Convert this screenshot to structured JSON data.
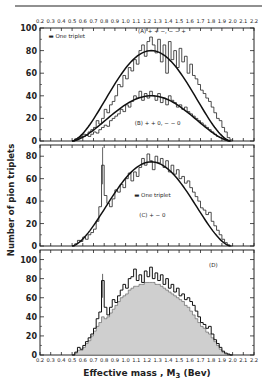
{
  "chart_data": {
    "type": "bar",
    "title": "",
    "xlabel": "Effective mass , M3 (Bev)",
    "xlabel_main": "Effective mass , M",
    "xlabel_sub": "3",
    "xlabel_tail": " (Bev)",
    "ylabel": "Number of pion triplets",
    "xlim": [
      0.2,
      2.2
    ],
    "xticks": [
      "0.2",
      "0.3",
      "0.4",
      "0.5",
      "0.6",
      "0.7",
      "0.8",
      "0.9",
      "1.0",
      "1.1",
      "1.2",
      "1.3",
      "1.4",
      "1.5",
      "1.6",
      "1.7",
      "1.8",
      "1.9",
      "2.0",
      "2.1",
      "2.2"
    ],
    "bin_start": 0.5,
    "bin_width": 0.025,
    "panels": [
      {
        "id": "A",
        "ylim": [
          0,
          100
        ],
        "yticks": [
          "0",
          "20",
          "40",
          "60",
          "80",
          "100"
        ],
        "labels": [
          {
            "text": "(A) + + −, − − +",
            "x": 1.34,
            "y": 96
          },
          {
            "text": "(B) + + 0, − − 0",
            "x": 1.3,
            "y": 14
          },
          {
            "text": "▬ One triplet",
            "x": 0.45,
            "y": 91
          }
        ],
        "series": [
          {
            "name": "(A) ++−,−−+",
            "values": [
              0,
              2,
              3,
              4,
              6,
              5,
              8,
              10,
              12,
              18,
              15,
              20,
              28,
              25,
              32,
              35,
              40,
              50,
              48,
              58,
              55,
              65,
              62,
              72,
              68,
              80,
              85,
              75,
              88,
              92,
              85,
              78,
              90,
              70,
              85,
              60,
              88,
              72,
              80,
              65,
              82,
              70,
              75,
              60,
              68,
              58,
              55,
              50,
              45,
              42,
              38,
              35,
              30,
              25,
              20,
              18,
              12,
              8,
              3,
              1
            ],
            "fit_peak": 80,
            "fit_center": 1.26
          },
          {
            "name": "(B) ++0,−−0",
            "values": [
              0,
              1,
              2,
              3,
              4,
              5,
              4,
              6,
              8,
              7,
              10,
              12,
              14,
              13,
              18,
              20,
              22,
              24,
              28,
              26,
              32,
              30,
              35,
              40,
              38,
              44,
              36,
              42,
              38,
              44,
              40,
              36,
              42,
              34,
              38,
              32,
              40,
              36,
              34,
              30,
              32,
              28,
              30,
              26,
              24,
              22,
              20,
              18,
              16,
              14,
              12,
              10,
              8,
              6,
              4,
              3,
              2,
              1,
              0,
              0
            ],
            "fit_peak": 40,
            "fit_center": 1.26
          }
        ]
      },
      {
        "id": "C",
        "ylim": [
          0,
          90
        ],
        "yticks": [
          "0",
          "20",
          "40",
          "60",
          "80"
        ],
        "labels": [
          {
            "text": "▬ One triplet",
            "x": 1.25,
            "y": 44
          },
          {
            "text": "(C) + − 0",
            "x": 1.25,
            "y": 26
          }
        ],
        "series": [
          {
            "name": "(C) +−0",
            "values": [
              0,
              2,
              5,
              4,
              8,
              6,
              10,
              12,
              15,
              22,
              35,
              72,
              45,
              38,
              35,
              42,
              50,
              48,
              55,
              52,
              60,
              65,
              58,
              66,
              62,
              70,
              78,
              72,
              82,
              76,
              68,
              80,
              74,
              78,
              70,
              76,
              66,
              72,
              64,
              68,
              60,
              62,
              56,
              58,
              52,
              48,
              44,
              40,
              34,
              32,
              28,
              30,
              22,
              18,
              14,
              10,
              6,
              3,
              1,
              0
            ],
            "fit_peak": 75,
            "fit_center": 1.25
          }
        ]
      },
      {
        "id": "D",
        "ylim": [
          0,
          110
        ],
        "yticks": [
          "0",
          "20",
          "40",
          "60",
          "80",
          "100"
        ],
        "labels": [
          {
            "text": "(D)",
            "x": 1.82,
            "y": 92
          }
        ],
        "series": [
          {
            "name": "(D) total",
            "values": [
              0,
              3,
              8,
              6,
              10,
              14,
              18,
              22,
              28,
              38,
              45,
              78,
              50,
              42,
              50,
              58,
              55,
              62,
              68,
              74,
              70,
              80,
              82,
              90,
              78,
              84,
              76,
              88,
              82,
              92,
              80,
              86,
              78,
              84,
              74,
              80,
              70,
              74,
              66,
              70,
              62,
              64,
              58,
              60,
              56,
              52,
              46,
              40,
              34,
              32,
              28,
              30,
              22,
              16,
              12,
              8,
              4,
              2,
              1,
              0
            ]
          },
          {
            "name": "(D) shaded",
            "values": [
              0,
              2,
              5,
              5,
              8,
              12,
              15,
              20,
              25,
              30,
              34,
              40,
              38,
              40,
              44,
              48,
              52,
              56,
              60,
              62,
              64,
              68,
              70,
              72,
              72,
              74,
              74,
              76,
              76,
              76,
              76,
              74,
              74,
              72,
              70,
              68,
              66,
              64,
              62,
              60,
              58,
              56,
              52,
              50,
              46,
              42,
              38,
              34,
              30,
              28,
              24,
              22,
              18,
              14,
              10,
              6,
              3,
              1,
              0,
              0
            ]
          }
        ]
      }
    ]
  }
}
